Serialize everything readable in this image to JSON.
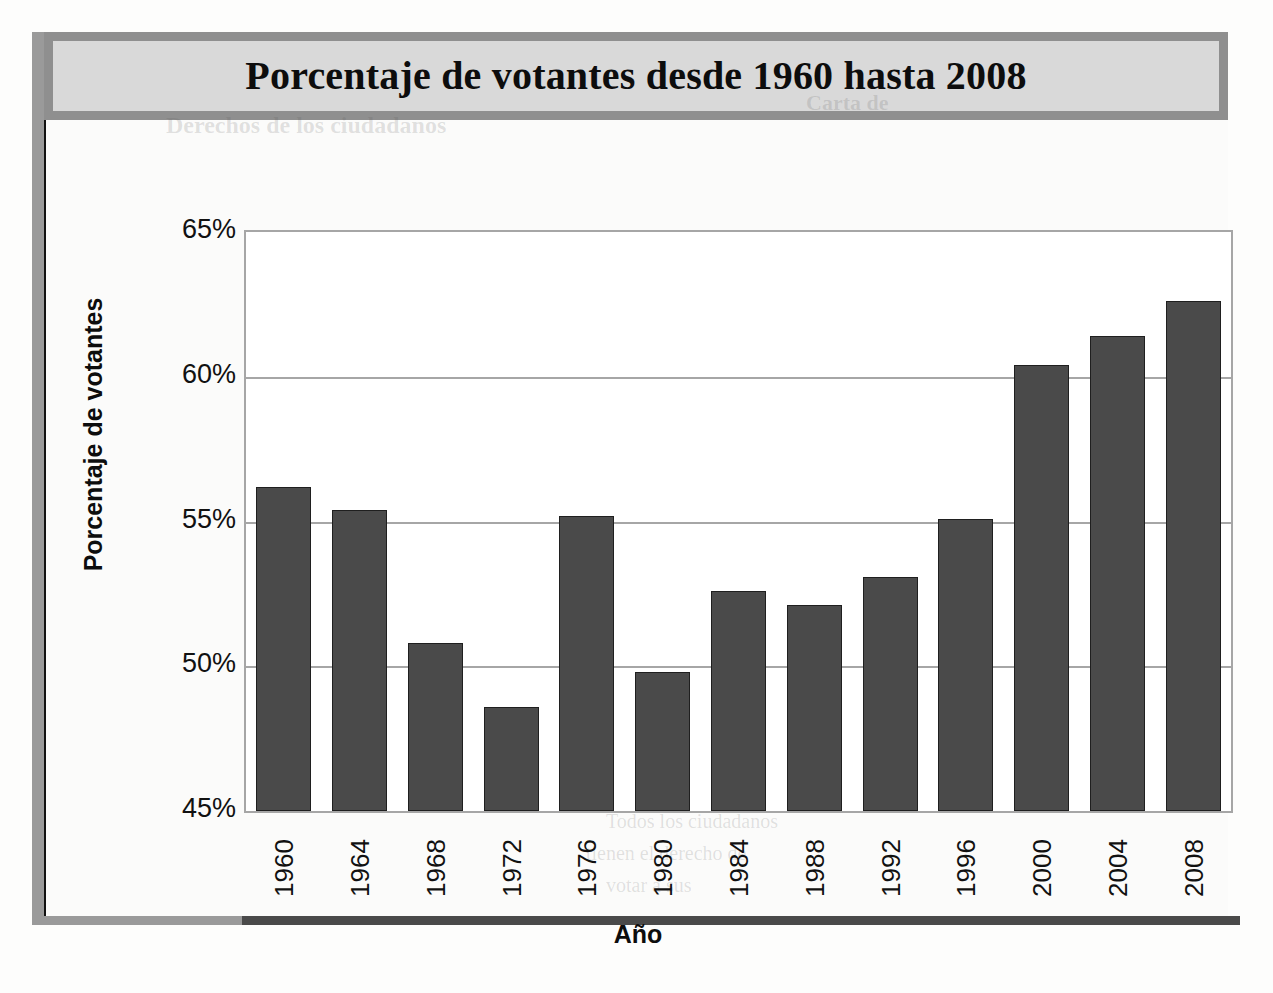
{
  "title": "Porcentaje de votantes desde 1960 hasta 2008",
  "axis": {
    "x_title": "Año",
    "y_title": "Porcentaje de votantes"
  },
  "colors": {
    "bar_fill": "#4a4a4a",
    "bar_stroke": "#1f1f1f",
    "grid": "#a6a6a6",
    "title_bar_fill": "#d9d9d9",
    "title_bar_border": "#8f8f8f",
    "plot_bg": "#ffffff"
  },
  "bleed_through": {
    "line1": "Derechos de los ciudadanos",
    "line2": "Carta de",
    "line3": "Todos los ciudadanos",
    "line4": "tienen el derecho de",
    "line5": "votar a sus"
  },
  "chart_data": {
    "type": "bar",
    "title": "Porcentaje de votantes desde 1960 hasta 2008",
    "xlabel": "Año",
    "ylabel": "Porcentaje de votantes",
    "categories": [
      "1960",
      "1964",
      "1968",
      "1972",
      "1976",
      "1980",
      "1984",
      "1988",
      "1992",
      "1996",
      "2000",
      "2004",
      "2008"
    ],
    "values": [
      56.2,
      55.4,
      50.8,
      48.6,
      55.2,
      49.8,
      52.6,
      52.1,
      53.1,
      55.1,
      60.4,
      61.4,
      62.6
    ],
    "value_labels": [
      "56.2%",
      "55.4%",
      "50.8%",
      "48.6%",
      "55.2%",
      "49.8%",
      "52.6%",
      "52.1%",
      "53.1%",
      "55.1%",
      "60.4%",
      "61.4%",
      "62.6%"
    ],
    "ylim": [
      45,
      65
    ],
    "yticks": [
      65,
      60,
      55,
      50,
      45
    ],
    "ytick_labels": [
      "65%",
      "60%",
      "55%",
      "50%",
      "45%"
    ],
    "grid": true,
    "legend": "none"
  }
}
